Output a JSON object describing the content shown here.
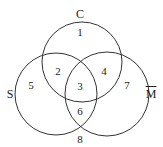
{
  "diagram": {
    "type": "venn",
    "sets": [
      {
        "label": "C",
        "cx": 82,
        "cy": 62,
        "r": 40
      },
      {
        "label": "S",
        "cx": 56,
        "cy": 94,
        "r": 41
      },
      {
        "label": "M",
        "cx": 107,
        "cy": 94,
        "r": 42,
        "complement": true
      }
    ],
    "set_labels": {
      "c": "C",
      "s": "S",
      "m": "M"
    },
    "regions": {
      "r1": "1",
      "r2": "2",
      "r3": "3",
      "r4": "4",
      "r5": "5",
      "r6": "6",
      "r7": "7",
      "r8": "8"
    },
    "stroke_color": "#333333"
  }
}
